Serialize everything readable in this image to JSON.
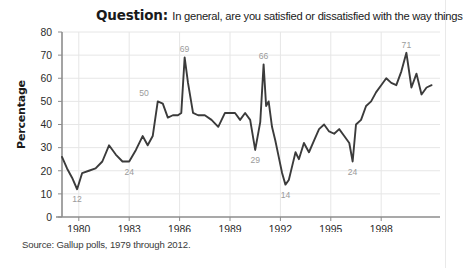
{
  "title": {
    "lead": "Question:",
    "text": "In general, are you satisfied or dissatisfied with the way things"
  },
  "source": "Source: Gallup polls, 1979 through 2012.",
  "chart_data": {
    "type": "line",
    "title": "Question: In general, are you satisfied or dissatisfied with the way things",
    "xlabel": "",
    "ylabel": "Percentage",
    "ylim": [
      0,
      80
    ],
    "xlim": [
      1979,
      2001.5
    ],
    "yticks": [
      0,
      10,
      20,
      30,
      40,
      50,
      60,
      70,
      80
    ],
    "xticks": [
      1980,
      1983,
      1986,
      1989,
      1992,
      1995,
      1998
    ],
    "grid": "both-light",
    "legend": "none",
    "line_color": "#3b3b3b",
    "series": [
      {
        "name": "Percent satisfied with the way things are going",
        "x": [
          1979.0,
          1979.3,
          1979.6,
          1979.9,
          1980.2,
          1980.6,
          1981.0,
          1981.4,
          1981.8,
          1982.2,
          1982.6,
          1983.0,
          1983.4,
          1983.8,
          1984.1,
          1984.4,
          1984.7,
          1985.0,
          1985.3,
          1985.6,
          1985.9,
          1986.1,
          1986.3,
          1986.5,
          1986.8,
          1987.1,
          1987.5,
          1987.9,
          1988.3,
          1988.7,
          1989.0,
          1989.3,
          1989.6,
          1989.9,
          1990.2,
          1990.5,
          1990.8,
          1991.0,
          1991.15,
          1991.3,
          1991.5,
          1991.7,
          1991.9,
          1992.1,
          1992.3,
          1992.5,
          1992.7,
          1992.9,
          1993.1,
          1993.4,
          1993.7,
          1994.0,
          1994.3,
          1994.6,
          1994.9,
          1995.2,
          1995.5,
          1995.8,
          1996.1,
          1996.3,
          1996.5,
          1996.8,
          1997.1,
          1997.4,
          1997.7,
          1998.0,
          1998.3,
          1998.6,
          1998.9,
          1999.2,
          1999.5,
          1999.8,
          2000.1,
          2000.4,
          2000.7,
          2001.0
        ],
        "y": [
          26,
          21,
          17,
          12,
          19,
          20,
          21,
          24,
          31,
          27,
          24,
          24,
          29,
          35,
          31,
          35,
          50,
          49,
          43,
          44,
          44,
          45,
          69,
          58,
          45,
          44,
          44,
          42,
          39,
          45,
          45,
          45,
          42,
          45,
          42,
          29,
          41,
          66,
          48,
          50,
          39,
          33,
          26,
          19,
          14,
          16,
          22,
          28,
          25,
          32,
          28,
          33,
          38,
          40,
          37,
          36,
          38,
          35,
          32,
          24,
          40,
          42,
          48,
          50,
          54,
          57,
          60,
          58,
          57,
          63,
          71,
          56,
          62,
          53,
          56,
          57
        ]
      }
    ],
    "annotations": [
      {
        "label": "12",
        "x": 1979.9,
        "y": 12,
        "position": "below"
      },
      {
        "label": "24",
        "x": 1983.0,
        "y": 24,
        "position": "below"
      },
      {
        "label": "50",
        "x": 1984.7,
        "y": 50,
        "position": "above-left"
      },
      {
        "label": "69",
        "x": 1986.3,
        "y": 69,
        "position": "above"
      },
      {
        "label": "29",
        "x": 1990.5,
        "y": 29,
        "position": "below"
      },
      {
        "label": "66",
        "x": 1991.0,
        "y": 66,
        "position": "above"
      },
      {
        "label": "14",
        "x": 1992.3,
        "y": 14,
        "position": "below"
      },
      {
        "label": "24",
        "x": 1996.3,
        "y": 24,
        "position": "below"
      },
      {
        "label": "71",
        "x": 1999.5,
        "y": 71,
        "position": "above"
      }
    ]
  }
}
